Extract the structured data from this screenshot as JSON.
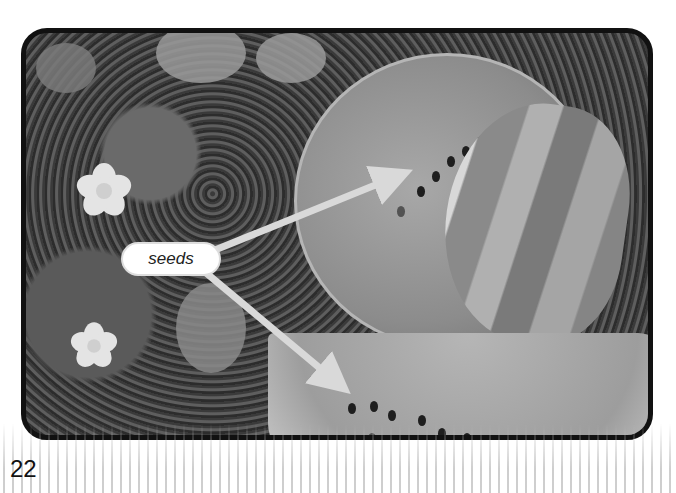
{
  "page": {
    "number": "22"
  },
  "photo": {
    "subject": "watermelon halves and slice with vine and flowers",
    "label": "seeds",
    "arrow_count": 2
  },
  "colors": {
    "frame_border": "#111111",
    "label_bg": "#ffffff",
    "arrow": "#d9d9d9",
    "text": "#222222"
  }
}
